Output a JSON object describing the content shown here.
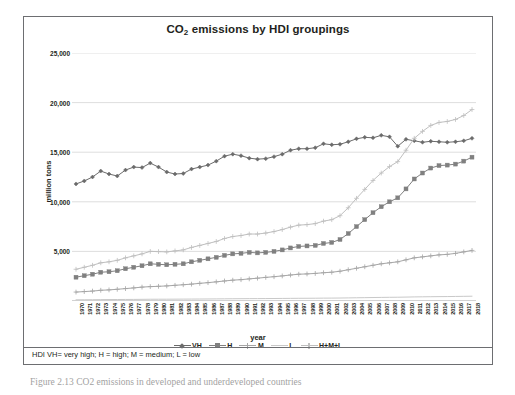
{
  "figure": {
    "caption": "Figure 2.13  CO2 emissions in developed and underdeveloped countries"
  },
  "footnote": {
    "text": "HDI VH= very high; H = high; M = medium; L = low"
  },
  "chart_data": {
    "type": "line",
    "title": "CO2 emissions by HDI groupings",
    "title_main": "CO",
    "title_sub": "2",
    "title_rest": " emissions by HDI groupings",
    "xlabel": "year",
    "ylabel": "million tons",
    "ylim": [
      0,
      25000
    ],
    "yticks": [
      0,
      5000,
      10000,
      15000,
      20000,
      25000
    ],
    "ytick_labels": [
      "",
      "5,000",
      "10,000",
      "15,000",
      "20,000",
      "25,000"
    ],
    "grid": "horizontal",
    "legend_position": "bottom",
    "x": [
      1970,
      1971,
      1972,
      1973,
      1974,
      1975,
      1976,
      1977,
      1978,
      1979,
      1980,
      1981,
      1982,
      1983,
      1984,
      1985,
      1986,
      1987,
      1988,
      1989,
      1990,
      1991,
      1992,
      1993,
      1994,
      1995,
      1996,
      1997,
      1998,
      1999,
      2000,
      2001,
      2002,
      2003,
      2004,
      2005,
      2006,
      2007,
      2008,
      2009,
      2010,
      2011,
      2012,
      2013,
      2014,
      2015,
      2016,
      2017,
      2018
    ],
    "series": [
      {
        "name": "VH",
        "color": "#6b6b6b",
        "marker": "diamond",
        "values": [
          11800,
          12100,
          12500,
          13100,
          12800,
          12600,
          13200,
          13500,
          13450,
          13900,
          13500,
          13000,
          12800,
          12850,
          13300,
          13500,
          13700,
          14100,
          14600,
          14800,
          14650,
          14400,
          14300,
          14350,
          14550,
          14800,
          15200,
          15350,
          15350,
          15450,
          15850,
          15750,
          15800,
          16050,
          16350,
          16500,
          16450,
          16700,
          16550,
          15600,
          16300,
          16150,
          16000,
          16100,
          16050,
          16000,
          16050,
          16150,
          16400
        ]
      },
      {
        "name": "H",
        "color": "#808080",
        "marker": "square",
        "values": [
          2400,
          2550,
          2700,
          2900,
          2950,
          3050,
          3250,
          3400,
          3550,
          3750,
          3700,
          3650,
          3700,
          3750,
          3950,
          4100,
          4250,
          4400,
          4600,
          4750,
          4800,
          4900,
          4850,
          4900,
          5000,
          5150,
          5350,
          5500,
          5550,
          5600,
          5800,
          5900,
          6200,
          6800,
          7500,
          8200,
          8900,
          9500,
          10000,
          10400,
          11300,
          12300,
          12900,
          13400,
          13650,
          13700,
          13800,
          14100,
          14500
        ]
      },
      {
        "name": "M",
        "color": "#a6a6a6",
        "marker": "plus",
        "values": [
          900,
          950,
          1000,
          1080,
          1120,
          1180,
          1250,
          1320,
          1400,
          1450,
          1480,
          1520,
          1580,
          1640,
          1700,
          1780,
          1850,
          1930,
          2020,
          2100,
          2150,
          2230,
          2300,
          2380,
          2450,
          2530,
          2620,
          2700,
          2730,
          2780,
          2850,
          2900,
          3000,
          3150,
          3300,
          3450,
          3600,
          3750,
          3850,
          3950,
          4150,
          4350,
          4450,
          4550,
          4650,
          4700,
          4800,
          4950,
          5100
        ]
      },
      {
        "name": "L",
        "color": "#c9c9c9",
        "marker": "none",
        "values": [
          120,
          125,
          130,
          140,
          145,
          150,
          155,
          160,
          168,
          175,
          178,
          180,
          185,
          190,
          195,
          200,
          205,
          212,
          220,
          228,
          232,
          238,
          242,
          248,
          252,
          258,
          265,
          272,
          275,
          280,
          288,
          292,
          300,
          312,
          325,
          338,
          350,
          362,
          372,
          380,
          395,
          412,
          422,
          432,
          442,
          448,
          458,
          470,
          482
        ]
      },
      {
        "name": "H+M+L",
        "color": "#bfbfbf",
        "marker": "plus",
        "values": [
          3200,
          3400,
          3600,
          3850,
          3950,
          4100,
          4350,
          4550,
          4750,
          5000,
          4980,
          4950,
          5050,
          5150,
          5400,
          5600,
          5800,
          6000,
          6300,
          6500,
          6600,
          6750,
          6750,
          6850,
          7000,
          7200,
          7450,
          7650,
          7700,
          7800,
          8050,
          8200,
          8600,
          9400,
          10350,
          11250,
          12150,
          12900,
          13550,
          14050,
          15200,
          16400,
          17100,
          17700,
          18000,
          18100,
          18300,
          18700,
          19300
        ]
      }
    ]
  },
  "legend": {
    "items": [
      {
        "label": "VH",
        "color": "#6b6b6b",
        "marker": "diamond"
      },
      {
        "label": "H",
        "color": "#808080",
        "marker": "square"
      },
      {
        "label": "M",
        "color": "#a6a6a6",
        "marker": "plus"
      },
      {
        "label": "L",
        "color": "#c9c9c9",
        "marker": "none"
      },
      {
        "label": "H+M+L",
        "color": "#bfbfbf",
        "marker": "plus"
      }
    ]
  }
}
